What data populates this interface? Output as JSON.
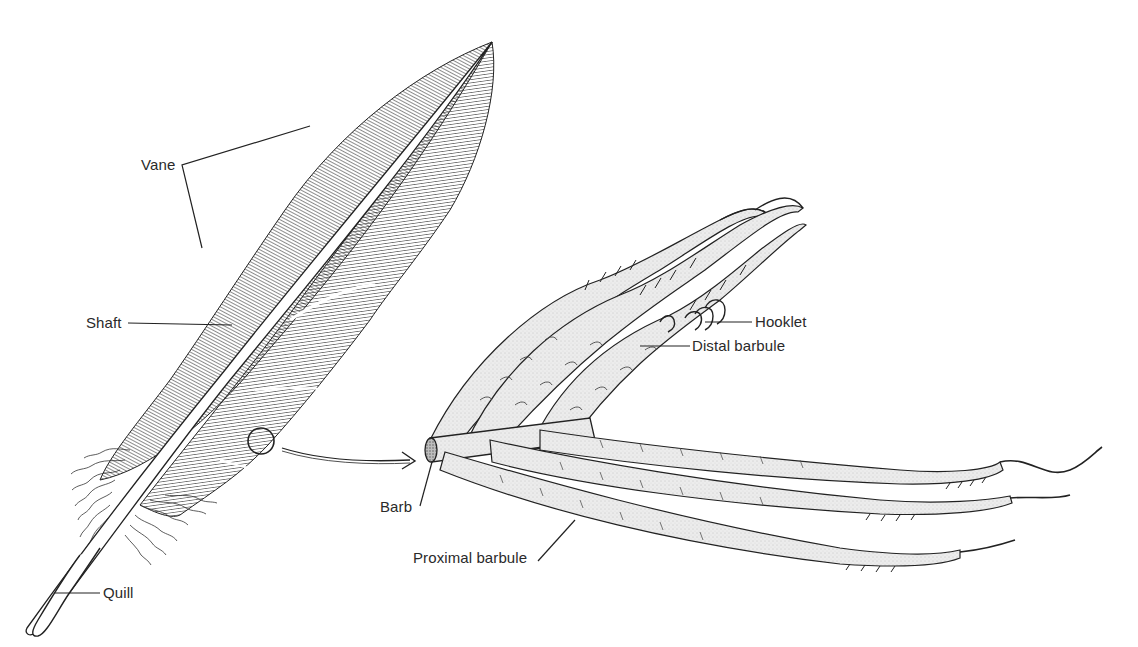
{
  "diagram": {
    "colors": {
      "ink": "#222222",
      "barbule_fill": "#e9e9e9",
      "background": "#ffffff"
    },
    "feather_labels": {
      "vane": "Vane",
      "shaft": "Shaft",
      "quill": "Quill"
    },
    "detail_labels": {
      "hooklet": "Hooklet",
      "distal_barbule": "Distal barbule",
      "barb": "Barb",
      "proximal_barbule": "Proximal barbule"
    },
    "magnifier": {
      "icon": "circle-magnifier-with-arrow"
    }
  }
}
